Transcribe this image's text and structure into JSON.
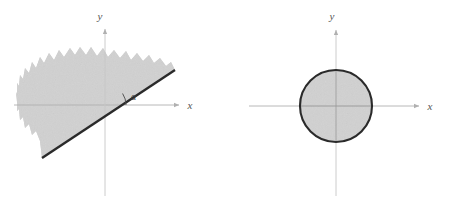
{
  "figure": {
    "title": "",
    "background_color": "#ffffff",
    "width": 453,
    "height": 204
  },
  "style": {
    "axis_color": "#b9b9b9",
    "axis_label_color": "#555555",
    "boundary_color": "#2a2a2a",
    "shade_fill": "#cfcfcf",
    "shade_fill_light": "#d6d6d6",
    "arc_color": "#4a4a4a"
  },
  "panels": [
    {
      "id": "half-plane",
      "name": "half-plane-panel",
      "origin": {
        "x": 105,
        "y": 105
      },
      "axes": {
        "x": {
          "label": "x",
          "label_pos": {
            "x": 190,
            "y": 109
          },
          "start": {
            "x": 14,
            "y": 105
          },
          "end": {
            "x": 182,
            "y": 105
          },
          "arrow": true
        },
        "y": {
          "label": "y",
          "label_pos": {
            "x": 100,
            "y": 19
          },
          "start": {
            "x": 105,
            "y": 196
          },
          "end": {
            "x": 105,
            "y": 26
          },
          "arrow": true
        }
      },
      "boundary_line": {
        "name": "half-plane-boundary-line",
        "from": {
          "x": 42,
          "y": 158
        },
        "to": {
          "x": 175,
          "y": 70
        },
        "width": 2.4,
        "angle_degrees": 33
      },
      "angle": {
        "label": "α",
        "label_pos": {
          "x": 131,
          "y": 99
        },
        "arc_radius": 20,
        "vertex": {
          "x": 105,
          "y": 105
        }
      },
      "region": {
        "name": "shaded-half-plane",
        "description": "gray shaded band above the inclined line",
        "edge": "rough"
      }
    },
    {
      "id": "disk",
      "name": "disk-panel",
      "origin": {
        "x": 336,
        "y": 106
      },
      "axes": {
        "x": {
          "label": "x",
          "label_pos": {
            "x": 430,
            "y": 110
          },
          "start": {
            "x": 249,
            "y": 106
          },
          "end": {
            "x": 422,
            "y": 106
          },
          "arrow": true
        },
        "y": {
          "label": "y",
          "label_pos": {
            "x": 332,
            "y": 19
          },
          "start": {
            "x": 336,
            "y": 196
          },
          "end": {
            "x": 336,
            "y": 27
          },
          "arrow": true
        }
      },
      "circle": {
        "name": "shaded-disk",
        "center": {
          "x": 336,
          "y": 106
        },
        "radius": 36,
        "stroke_width": 2.1
      }
    }
  ]
}
